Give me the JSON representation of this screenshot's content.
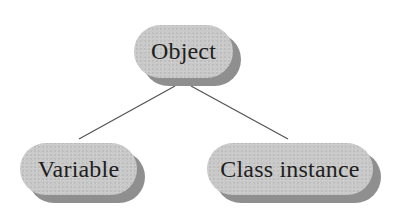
{
  "diagram": {
    "type": "tree",
    "colors": {
      "node_face": "#c9c9c9",
      "node_shadow": "#8f8f8f",
      "edge": "#555555",
      "text": "#1e1e1e",
      "background": "#ffffff"
    },
    "nodes": [
      {
        "id": "object",
        "label": "Object"
      },
      {
        "id": "variable",
        "label": "Variable"
      },
      {
        "id": "class_instance",
        "label": "Class instance"
      }
    ],
    "edges": [
      {
        "from": "object",
        "to": "variable"
      },
      {
        "from": "object",
        "to": "class_instance"
      }
    ]
  }
}
